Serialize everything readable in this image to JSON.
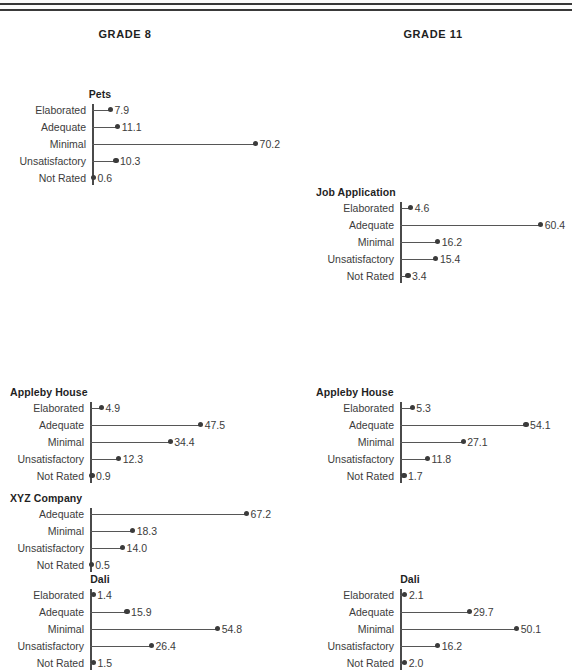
{
  "rules": [
    {
      "name": "top-rule-upper"
    },
    {
      "name": "top-rule-lower"
    }
  ],
  "headers": [
    {
      "label": "GRADE 8",
      "center_x": 125
    },
    {
      "label": "GRADE 11",
      "center_x": 433
    }
  ],
  "axis": {
    "categories": [
      "Elaborated",
      "Adequate",
      "Minimal",
      "Unsatisfactory",
      "Not Rated"
    ],
    "px_per_unit": 2.33,
    "value_max": 70.2
  },
  "chart_data": {
    "type": "line",
    "xlabel": "",
    "ylabel": "",
    "xlim": [
      0,
      72
    ],
    "grid": false,
    "legend": "none",
    "columns": [
      "GRADE 8",
      "GRADE 11"
    ],
    "categories": [
      "Elaborated",
      "Adequate",
      "Minimal",
      "Unsatisfactory",
      "Not Rated"
    ],
    "panels": [
      {
        "task": "Pets",
        "column": "GRADE 8",
        "title_align": "center",
        "title_center_x": 100,
        "top": 88,
        "axis_x": 92,
        "categories": [
          "Elaborated",
          "Adequate",
          "Minimal",
          "Unsatisfactory",
          "Not Rated"
        ],
        "values": [
          7.9,
          11.1,
          70.2,
          10.3,
          0.6
        ],
        "labels": [
          "7.9",
          "11.1",
          "70.2",
          "10.3",
          "0.6"
        ]
      },
      {
        "task": "Job Application",
        "column": "GRADE 11",
        "title_align": "left",
        "title_left_x": 316,
        "top": 186,
        "axis_x": 400,
        "categories": [
          "Elaborated",
          "Adequate",
          "Minimal",
          "Unsatisfactory",
          "Not Rated"
        ],
        "values": [
          4.6,
          60.4,
          16.2,
          15.4,
          3.4
        ],
        "labels": [
          "4.6",
          "60.4",
          "16.2",
          "15.4",
          "3.4"
        ]
      },
      {
        "task": "Appleby House",
        "column": "GRADE 8",
        "title_align": "left",
        "title_left_x": 10,
        "top": 386,
        "axis_x": 90,
        "categories": [
          "Elaborated",
          "Adequate",
          "Minimal",
          "Unsatisfactory",
          "Not Rated"
        ],
        "values": [
          4.9,
          47.5,
          34.4,
          12.3,
          0.9
        ],
        "labels": [
          "4.9",
          "47.5",
          "34.4",
          "12.3",
          "0.9"
        ]
      },
      {
        "task": "Appleby House",
        "column": "GRADE 11",
        "title_align": "left",
        "title_left_x": 316,
        "top": 386,
        "axis_x": 400,
        "categories": [
          "Elaborated",
          "Adequate",
          "Minimal",
          "Unsatisfactory",
          "Not Rated"
        ],
        "values": [
          5.3,
          54.1,
          27.1,
          11.8,
          1.7
        ],
        "labels": [
          "5.3",
          "54.1",
          "27.1",
          "11.8",
          "1.7"
        ]
      },
      {
        "task": "XYZ Company",
        "column": "GRADE 8",
        "title_align": "left",
        "title_left_x": 10,
        "top": 492,
        "axis_x": 90,
        "categories": [
          "Adequate",
          "Minimal",
          "Unsatisfactory",
          "Not Rated"
        ],
        "values": [
          67.2,
          18.3,
          14.0,
          0.5
        ],
        "labels": [
          "67.2",
          "18.3",
          "14.0",
          "0.5"
        ]
      },
      {
        "task": "Dali",
        "column": "GRADE 8",
        "title_align": "center",
        "title_center_x": 100,
        "top": 573,
        "axis_x": 90,
        "categories": [
          "Elaborated",
          "Adequate",
          "Minimal",
          "Unsatisfactory",
          "Not Rated"
        ],
        "values": [
          1.4,
          15.9,
          54.8,
          26.4,
          1.5
        ],
        "labels": [
          "1.4",
          "15.9",
          "54.8",
          "26.4",
          "1.5"
        ]
      },
      {
        "task": "Dali",
        "column": "GRADE 11",
        "title_align": "center",
        "title_center_x": 410,
        "top": 573,
        "axis_x": 400,
        "categories": [
          "Elaborated",
          "Adequate",
          "Minimal",
          "Unsatisfactory",
          "Not Rated"
        ],
        "values": [
          2.1,
          29.7,
          50.1,
          16.2,
          2.0
        ],
        "labels": [
          "2.1",
          "29.7",
          "50.1",
          "16.2",
          "2.0"
        ]
      }
    ]
  },
  "colors": {
    "rule": "#3a3a3a",
    "axis": "#4a4a4a",
    "stem": "#565656",
    "dot": "#3b3b3b",
    "text": "#3c3c3c",
    "title": "#1f1f1f",
    "background": "#ffffff"
  }
}
